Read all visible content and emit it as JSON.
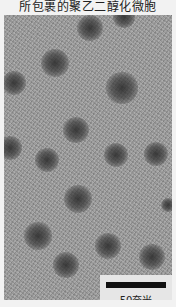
{
  "caption": "所包裹的聚乙二醇化微胞",
  "scale_bar": {
    "label": "50奈米"
  },
  "particles": [
    {
      "x": 90,
      "y": 28,
      "r": 11
    },
    {
      "x": 124,
      "y": 17,
      "r": 9
    },
    {
      "x": 55,
      "y": 63,
      "r": 12
    },
    {
      "x": 14,
      "y": 83,
      "r": 10
    },
    {
      "x": 122,
      "y": 88,
      "r": 13
    },
    {
      "x": 76,
      "y": 130,
      "r": 11
    },
    {
      "x": 10,
      "y": 148,
      "r": 10
    },
    {
      "x": 47,
      "y": 160,
      "r": 10
    },
    {
      "x": 116,
      "y": 155,
      "r": 10
    },
    {
      "x": 156,
      "y": 154,
      "r": 10
    },
    {
      "x": 78,
      "y": 199,
      "r": 12
    },
    {
      "x": 38,
      "y": 236,
      "r": 12
    },
    {
      "x": 108,
      "y": 246,
      "r": 11
    },
    {
      "x": 152,
      "y": 257,
      "r": 11
    },
    {
      "x": 66,
      "y": 265,
      "r": 11
    },
    {
      "x": 168,
      "y": 205,
      "r": 6
    }
  ],
  "colors": {
    "background": "#9a9a9a",
    "particle": "#3a3a3a",
    "scale_bar": "#111111",
    "page": "#f2f2f2"
  }
}
